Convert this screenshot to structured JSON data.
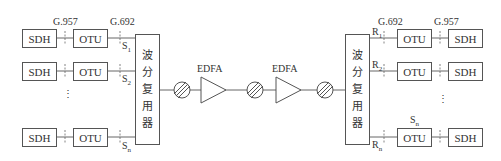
{
  "diagram": {
    "type": "WDM optical transmission system",
    "interface_labels": {
      "left_g957": "G.957",
      "left_g692": "G.692",
      "right_g692": "G.692",
      "right_g957": "G.957"
    },
    "transmit_side": {
      "channels": [
        {
          "sdh": "SDH",
          "otu": "OTU",
          "ref_point": "S",
          "sub": "1"
        },
        {
          "sdh": "SDH",
          "otu": "OTU",
          "ref_point": "S",
          "sub": "2"
        },
        {
          "sdh": "SDH",
          "otu": "OTU",
          "ref_point": "S",
          "sub": "n"
        }
      ],
      "ellipsis": "⋮",
      "multiplexer": {
        "chars": [
          "波",
          "分",
          "复",
          "用",
          "器"
        ]
      }
    },
    "line": {
      "amplifiers": [
        {
          "label": "EDFA"
        },
        {
          "label": "EDFA"
        }
      ],
      "attenuators": 3
    },
    "receive_side": {
      "demultiplexer": {
        "chars": [
          "波",
          "分",
          "复",
          "用",
          "器"
        ]
      },
      "channels": [
        {
          "ref_point": "R",
          "sub": "1",
          "otu": "OTU",
          "sdh": "SDH"
        },
        {
          "ref_point": "R",
          "sub": "2",
          "otu": "OTU",
          "sdh": "SDH"
        },
        {
          "ref_point": "R",
          "sub": "n",
          "otu": "OTU",
          "sdh": "SDH",
          "top_label": "S",
          "top_sub": "n"
        }
      ],
      "ellipsis": "⋮"
    }
  }
}
